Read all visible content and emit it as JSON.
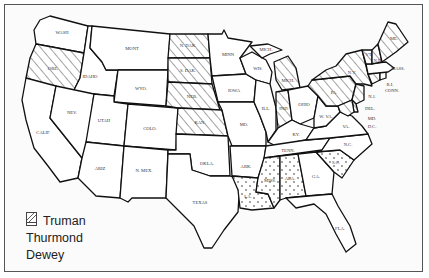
{
  "map": {
    "title": "1948 Presidential Election Results by State",
    "colors": {
      "border": "#111111",
      "background": "#fbfbfb",
      "hatch": "#333333",
      "dot": "#333333"
    },
    "candidates": [
      {
        "name": "Truman",
        "pattern": "blank"
      },
      {
        "name": "Thurmond",
        "pattern": "dots"
      },
      {
        "name": "Dewey",
        "pattern": "hatch"
      }
    ],
    "states": [
      {
        "label": "WASH",
        "winner": "Truman"
      },
      {
        "label": "ORE.",
        "winner": "Dewey"
      },
      {
        "label": "CALIF",
        "winner": "Truman"
      },
      {
        "label": "IDAHO",
        "winner": "Truman"
      },
      {
        "label": "NEV.",
        "winner": "Truman"
      },
      {
        "label": "MONT",
        "winner": "Truman"
      },
      {
        "label": "WYO.",
        "winner": "Truman"
      },
      {
        "label": "UTAH",
        "winner": "Truman"
      },
      {
        "label": "ARIZ",
        "winner": "Truman"
      },
      {
        "label": "COLO.",
        "winner": "Truman"
      },
      {
        "label": "N. MEX.",
        "winner": "Truman"
      },
      {
        "label": "N. DAK.",
        "winner": "Dewey"
      },
      {
        "label": "S. DAK.",
        "winner": "Dewey"
      },
      {
        "label": "NEB.",
        "winner": "Dewey"
      },
      {
        "label": "KAN.",
        "winner": "Dewey"
      },
      {
        "label": "OKLA.",
        "winner": "Truman"
      },
      {
        "label": "TEXAS",
        "winner": "Truman"
      },
      {
        "label": "MINN",
        "winner": "Truman"
      },
      {
        "label": "IOWA",
        "winner": "Truman"
      },
      {
        "label": "MO.",
        "winner": "Truman"
      },
      {
        "label": "ARK.",
        "winner": "Truman"
      },
      {
        "label": "LA.",
        "winner": "Thurmond"
      },
      {
        "label": "WIS.",
        "winner": "Truman"
      },
      {
        "label": "ILL.",
        "winner": "Truman"
      },
      {
        "label": "MICH.",
        "winner": "Dewey"
      },
      {
        "label": "IND.",
        "winner": "Dewey"
      },
      {
        "label": "OHIO",
        "winner": "Truman"
      },
      {
        "label": "KY.",
        "winner": "Truman"
      },
      {
        "label": "TENN.",
        "winner": "Truman"
      },
      {
        "label": "MISS.",
        "winner": "Thurmond"
      },
      {
        "label": "ALA.",
        "winner": "Thurmond"
      },
      {
        "label": "GA.",
        "winner": "Truman"
      },
      {
        "label": "FLA.",
        "winner": "Truman"
      },
      {
        "label": "S.C.",
        "winner": "Thurmond"
      },
      {
        "label": "N.C.",
        "winner": "Truman"
      },
      {
        "label": "VA.",
        "winner": "Truman"
      },
      {
        "label": "W. VA.",
        "winner": "Truman"
      },
      {
        "label": "PA.",
        "winner": "Dewey"
      },
      {
        "label": "N.Y.",
        "winner": "Dewey"
      },
      {
        "label": "N.J.",
        "winner": "Dewey"
      },
      {
        "label": "DEL.",
        "winner": "Dewey"
      },
      {
        "label": "MD.",
        "winner": "Dewey"
      },
      {
        "label": "D.C.",
        "winner": ""
      },
      {
        "label": "CONN.",
        "winner": "Dewey"
      },
      {
        "label": "R.I.",
        "winner": "Truman"
      },
      {
        "label": "MASS.",
        "winner": "Truman"
      },
      {
        "label": "VT.",
        "winner": "Dewey"
      },
      {
        "label": "N.H.",
        "winner": "Dewey"
      },
      {
        "label": "ME.",
        "winner": "Dewey"
      }
    ]
  },
  "legend": {
    "items": [
      {
        "label": "Truman",
        "pattern": "blank"
      },
      {
        "label": "Thurmond",
        "pattern": "dots"
      },
      {
        "label": "Dewey",
        "pattern": "hatch"
      }
    ]
  }
}
